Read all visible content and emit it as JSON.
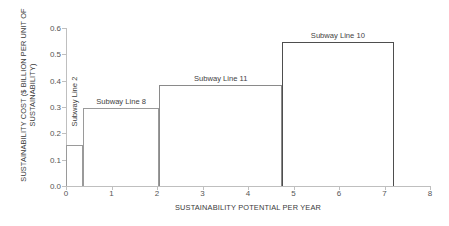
{
  "chart_data": {
    "type": "bar",
    "title": "",
    "subtitle": "",
    "xlabel": "SUSTAINABILITY POTENTIAL PER YEAR",
    "ylabel": "SUSTAINABILITY COST ($ BILLION PER UNIT OF SUSTAINABILITY)",
    "xlim": [
      0,
      8
    ],
    "ylim": [
      0.0,
      0.6
    ],
    "grid": false,
    "legend": "none",
    "xticks": [
      "0",
      "1",
      "2",
      "3",
      "4",
      "5",
      "6",
      "7",
      "8"
    ],
    "xtick_values": [
      0,
      1,
      2,
      3,
      4,
      5,
      6,
      7,
      8
    ],
    "yticks": [
      "0.0",
      "0.1",
      "0.2",
      "0.3",
      "0.4",
      "0.5",
      "0.6"
    ],
    "ytick_values": [
      0.0,
      0.1,
      0.2,
      0.3,
      0.4,
      0.5,
      0.6
    ],
    "annotation_note": "Supply-curve style step chart; each block spans a capacity range on x and a cost level on y",
    "blocks": [
      {
        "label": "Subway Line 2",
        "x_start": 0.0,
        "x_end": 0.37,
        "value": 0.155,
        "label_orientation": "vertical"
      },
      {
        "label": "Subway Line 8",
        "x_start": 0.37,
        "x_end": 2.05,
        "value": 0.295,
        "label_orientation": "horizontal"
      },
      {
        "label": "Subway Line 11",
        "x_start": 2.05,
        "x_end": 4.75,
        "value": 0.385,
        "label_orientation": "horizontal"
      },
      {
        "label": "Subway Line 10",
        "x_start": 4.75,
        "x_end": 7.2,
        "value": 0.545,
        "label_orientation": "horizontal"
      }
    ],
    "categories": [
      "Subway Line 2",
      "Subway Line 8",
      "Subway Line 11",
      "Subway Line 10"
    ],
    "values": [
      0.155,
      0.295,
      0.385,
      0.545
    ],
    "widths": [
      0.37,
      1.68,
      2.7,
      2.45
    ]
  },
  "colors": {
    "background": "#ffffff",
    "axis": "#bfbfbf",
    "step_line": "#808080",
    "step_line_dark": "#4e4e4e",
    "tick_text": "#555555",
    "title_text": "#3a3a3a"
  }
}
